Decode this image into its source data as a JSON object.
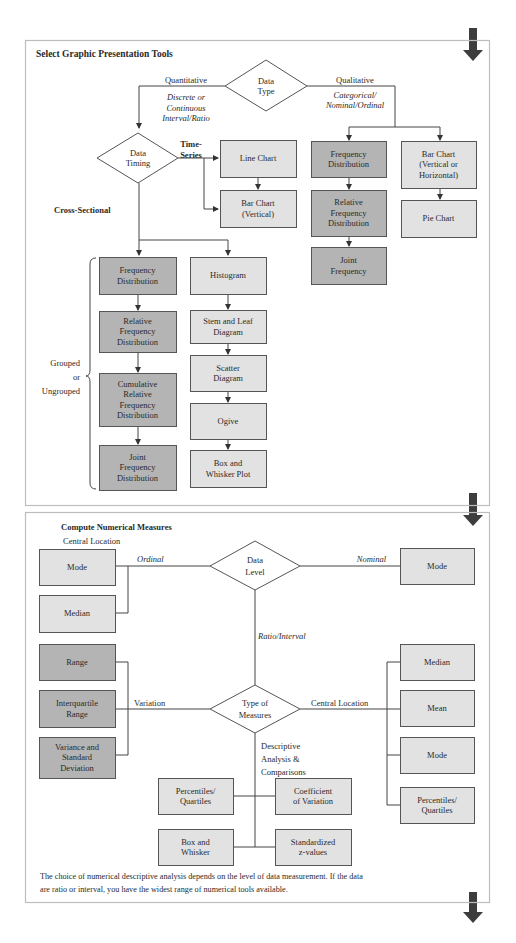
{
  "graphic": {
    "title": "Select Graphic Presentation Tools",
    "data_type": [
      "Data",
      "Type"
    ],
    "quantitative": "Quantitative",
    "quantitative_sub": [
      "Discrete or",
      "Continuous",
      "Interval/Ratio"
    ],
    "qualitative": "Qualitative",
    "qualitative_sub": [
      "Categorical/",
      "Nominal/Ordinal"
    ],
    "data_timing": [
      "Data",
      "Timing"
    ],
    "time_series": [
      "Time-",
      "Series"
    ],
    "cross_sectional": "Cross-Sectional",
    "line_chart": [
      "Line Chart"
    ],
    "bar_chart_vertical": [
      "Bar Chart",
      "(Vertical)"
    ],
    "qual_freq_dist": [
      "Frequency",
      "Distribution"
    ],
    "qual_rel_freq_dist": [
      "Relative",
      "Frequency",
      "Distribution"
    ],
    "qual_joint_freq": [
      "Joint",
      "Frequency"
    ],
    "bar_chart_vh": [
      "Bar Chart",
      "(Vertical or",
      "Horizontal)"
    ],
    "pie_chart": [
      "Pie Chart"
    ],
    "grouped_label": [
      "Grouped",
      "or",
      "Ungrouped"
    ],
    "freq_dist": [
      "Frequency",
      "Distribution"
    ],
    "rel_freq_dist": [
      "Relative",
      "Frequency",
      "Distribution"
    ],
    "cum_rel_freq_dist": [
      "Cumulative",
      "Relative",
      "Frequency",
      "Distribution"
    ],
    "joint_freq_dist": [
      "Joint",
      "Frequency",
      "Distribution"
    ],
    "histogram": [
      "Histogram"
    ],
    "stem_leaf": [
      "Stem and Leaf",
      "Diagram"
    ],
    "scatter": [
      "Scatter",
      "Diagram"
    ],
    "ogive": [
      "Ogive"
    ],
    "box_whisker_plot": [
      "Box and",
      "Whisker Plot"
    ]
  },
  "numerical": {
    "title": "Compute Numerical Measures",
    "subtitle": "Central Location",
    "mode_left": [
      "Mode"
    ],
    "median_left": [
      "Median"
    ],
    "ordinal": "Ordinal",
    "data_level": [
      "Data",
      "Level"
    ],
    "nominal": "Nominal",
    "mode_right": [
      "Mode"
    ],
    "ratio_interval": "Ratio/Interval",
    "range": [
      "Range"
    ],
    "iqr": [
      "Interquartile",
      "Range"
    ],
    "variance_sd": [
      "Variance and",
      "Standard",
      "Deviation"
    ],
    "variation": "Variation",
    "type_of_measures": [
      "Type of",
      "Measures"
    ],
    "central_location": "Central Location",
    "median_right": [
      "Median"
    ],
    "mean": [
      "Mean"
    ],
    "mode_right2": [
      "Mode"
    ],
    "percentiles_right": [
      "Percentiles/",
      "Quartiles"
    ],
    "descriptive": [
      "Descriptive",
      "Analysis &",
      "Comparisons"
    ],
    "percentiles_mid": [
      "Percentiles/",
      "Quartiles"
    ],
    "coef_variation": [
      "Coefficient",
      "of Variation"
    ],
    "box_whisker": [
      "Box and",
      "Whisker"
    ],
    "standardized": [
      "Standardized",
      "z-values"
    ],
    "note": [
      "The choice of numerical descriptive analysis depends on the level of data measurement. If the data",
      "are ratio or interval, you have the widest range of numerical tools available."
    ]
  },
  "colors": {
    "light_box": "#e2e2e2",
    "dark_box": "#b4b4b4",
    "arrow": "#3d3d3d",
    "panel_border": "#bdbdbd"
  }
}
